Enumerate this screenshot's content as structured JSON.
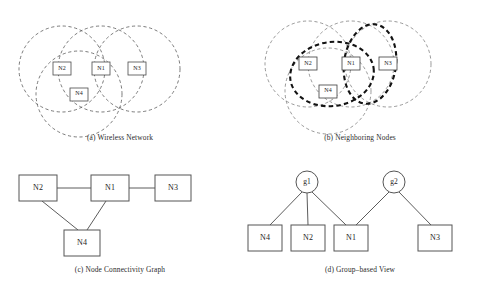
{
  "figure": {
    "background_color": "#ffffff",
    "line_color": "#555555",
    "bold_line_color": "#111111",
    "box_stroke_color": "#4a4a4a",
    "text_color": "#1c1c1c"
  },
  "panels": {
    "a": {
      "caption": "(a) Wireless Network",
      "nodes": [
        {
          "id": "n2",
          "label": "N2",
          "x": 62,
          "y": 67
        },
        {
          "id": "n1",
          "label": "N1",
          "x": 101,
          "y": 67
        },
        {
          "id": "n3",
          "label": "N3",
          "x": 137,
          "y": 67
        },
        {
          "id": "n4",
          "label": "N4",
          "x": 79,
          "y": 92
        }
      ],
      "ranges": [
        {
          "id": "range-n2",
          "cx": 62,
          "cy": 67,
          "r": 43
        },
        {
          "id": "range-n1",
          "cx": 101,
          "cy": 67,
          "r": 43
        },
        {
          "id": "range-n3",
          "cx": 137,
          "cy": 67,
          "r": 43
        },
        {
          "id": "range-n4",
          "cx": 79,
          "cy": 92,
          "r": 43
        }
      ]
    },
    "b": {
      "caption": "(b) Neighboring Nodes",
      "nodes": [
        {
          "id": "n2",
          "label": "N2",
          "x": 68,
          "y": 62
        },
        {
          "id": "n1",
          "label": "N1",
          "x": 111,
          "y": 62
        },
        {
          "id": "n3",
          "label": "N3",
          "x": 148,
          "y": 62
        },
        {
          "id": "n4",
          "label": "N4",
          "x": 88,
          "y": 89
        }
      ],
      "ranges": [
        {
          "id": "range-n2",
          "cx": 68,
          "cy": 62,
          "r": 43
        },
        {
          "id": "range-n1",
          "cx": 111,
          "cy": 62,
          "r": 43
        },
        {
          "id": "range-n3",
          "cx": 148,
          "cy": 62,
          "r": 43
        },
        {
          "id": "range-n4",
          "cx": 88,
          "cy": 89,
          "r": 43
        }
      ],
      "groups": [
        {
          "id": "group-g1",
          "label": "g1",
          "members": [
            "N2",
            "N1",
            "N4"
          ],
          "cx": 92,
          "cy": 72,
          "rx": 42,
          "ry": 32,
          "rotate": -8
        },
        {
          "id": "group-g2",
          "label": "g2",
          "members": [
            "N1",
            "N3"
          ],
          "cx": 130,
          "cy": 62,
          "rx": 26,
          "ry": 40,
          "rotate": 8
        }
      ]
    },
    "c": {
      "caption": "(c) Node Connectivity Graph",
      "nodes": [
        {
          "id": "n2",
          "label": "N2",
          "x": 38,
          "y": 28
        },
        {
          "id": "n1",
          "label": "N1",
          "x": 110,
          "y": 28
        },
        {
          "id": "n3",
          "label": "N3",
          "x": 173,
          "y": 28
        },
        {
          "id": "n4",
          "label": "N4",
          "x": 82,
          "y": 83
        }
      ],
      "edges": [
        {
          "id": "edge-n2-n1",
          "from": "N2",
          "to": "N1"
        },
        {
          "id": "edge-n1-n3",
          "from": "N1",
          "to": "N3"
        },
        {
          "id": "edge-n2-n4",
          "from": "N2",
          "to": "N4"
        },
        {
          "id": "edge-n1-n4",
          "from": "N1",
          "to": "N4"
        }
      ]
    },
    "d": {
      "caption": "(d) Group–based View",
      "groups": [
        {
          "id": "g1",
          "label": "g1",
          "x": 67,
          "y": 22
        },
        {
          "id": "g2",
          "label": "g2",
          "x": 154,
          "y": 22
        }
      ],
      "nodes": [
        {
          "id": "n4",
          "label": "N4",
          "x": 25,
          "y": 78
        },
        {
          "id": "n2",
          "label": "N2",
          "x": 68,
          "y": 78
        },
        {
          "id": "n1",
          "label": "N1",
          "x": 111,
          "y": 78
        },
        {
          "id": "n3",
          "label": "N3",
          "x": 195,
          "y": 78
        }
      ],
      "edges": [
        {
          "id": "edge-g1-n4",
          "from": "g1",
          "to": "N4"
        },
        {
          "id": "edge-g1-n2",
          "from": "g1",
          "to": "N2"
        },
        {
          "id": "edge-g1-n1",
          "from": "g1",
          "to": "N1"
        },
        {
          "id": "edge-g2-n1",
          "from": "g2",
          "to": "N1"
        },
        {
          "id": "edge-g2-n3",
          "from": "g2",
          "to": "N3"
        }
      ]
    }
  }
}
